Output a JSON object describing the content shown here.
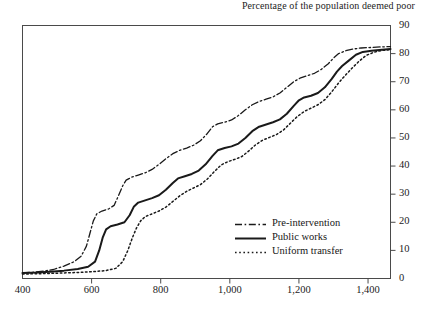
{
  "chart_data": {
    "type": "line",
    "title": "Percentage of the population deemed poor",
    "xlabel": "",
    "ylabel": "",
    "xlim": [
      400,
      1465
    ],
    "ylim": [
      0,
      90
    ],
    "grid": false,
    "legend_position": "inside-bottom-right",
    "xticks": [
      400,
      600,
      800,
      1000,
      1200,
      1400
    ],
    "xtick_labels": [
      "400",
      "600",
      "800",
      "1,000",
      "1,200",
      "1,400"
    ],
    "yticks": [
      0,
      10,
      20,
      30,
      40,
      50,
      60,
      70,
      80,
      90
    ],
    "ytick_labels": [
      "0",
      "10",
      "20",
      "30",
      "40",
      "50",
      "60",
      "70",
      "80",
      "90"
    ],
    "yaxis_side": "right",
    "series": [
      {
        "name": "Pre-intervention",
        "style": "dashdot",
        "points": [
          [
            400,
            2.0
          ],
          [
            430,
            2.2
          ],
          [
            460,
            2.6
          ],
          [
            490,
            3.2
          ],
          [
            520,
            4.4
          ],
          [
            550,
            6.0
          ],
          [
            570,
            8.0
          ],
          [
            585,
            11.5
          ],
          [
            595,
            16.0
          ],
          [
            605,
            20.5
          ],
          [
            615,
            23.0
          ],
          [
            630,
            24.0
          ],
          [
            650,
            24.8
          ],
          [
            665,
            26.0
          ],
          [
            678,
            29.5
          ],
          [
            690,
            33.0
          ],
          [
            700,
            35.0
          ],
          [
            715,
            36.0
          ],
          [
            735,
            36.8
          ],
          [
            755,
            37.6
          ],
          [
            775,
            38.8
          ],
          [
            795,
            40.6
          ],
          [
            815,
            42.6
          ],
          [
            835,
            44.4
          ],
          [
            855,
            45.6
          ],
          [
            875,
            46.4
          ],
          [
            895,
            47.4
          ],
          [
            915,
            49.0
          ],
          [
            935,
            51.6
          ],
          [
            950,
            54.0
          ],
          [
            965,
            55.0
          ],
          [
            985,
            55.6
          ],
          [
            1005,
            56.4
          ],
          [
            1025,
            58.0
          ],
          [
            1045,
            60.0
          ],
          [
            1065,
            61.8
          ],
          [
            1085,
            63.0
          ],
          [
            1105,
            63.8
          ],
          [
            1125,
            64.6
          ],
          [
            1145,
            66.0
          ],
          [
            1165,
            68.0
          ],
          [
            1185,
            70.0
          ],
          [
            1205,
            71.4
          ],
          [
            1225,
            72.2
          ],
          [
            1245,
            73.0
          ],
          [
            1265,
            74.4
          ],
          [
            1285,
            76.4
          ],
          [
            1300,
            78.4
          ],
          [
            1315,
            80.0
          ],
          [
            1335,
            81.0
          ],
          [
            1355,
            81.6
          ],
          [
            1380,
            82.0
          ],
          [
            1410,
            82.2
          ],
          [
            1440,
            82.4
          ],
          [
            1465,
            82.5
          ]
        ]
      },
      {
        "name": "Public works",
        "style": "solid",
        "points": [
          [
            400,
            2.0
          ],
          [
            440,
            2.1
          ],
          [
            480,
            2.4
          ],
          [
            520,
            2.8
          ],
          [
            560,
            3.4
          ],
          [
            590,
            4.2
          ],
          [
            610,
            6.0
          ],
          [
            622,
            10.0
          ],
          [
            632,
            14.5
          ],
          [
            642,
            17.5
          ],
          [
            655,
            18.6
          ],
          [
            675,
            19.2
          ],
          [
            695,
            20.0
          ],
          [
            710,
            22.5
          ],
          [
            722,
            25.5
          ],
          [
            735,
            27.0
          ],
          [
            755,
            27.8
          ],
          [
            775,
            28.6
          ],
          [
            795,
            29.6
          ],
          [
            815,
            31.6
          ],
          [
            835,
            34.0
          ],
          [
            850,
            35.6
          ],
          [
            870,
            36.4
          ],
          [
            890,
            37.2
          ],
          [
            910,
            38.4
          ],
          [
            930,
            40.6
          ],
          [
            950,
            43.6
          ],
          [
            965,
            45.6
          ],
          [
            985,
            46.4
          ],
          [
            1005,
            47.0
          ],
          [
            1025,
            48.0
          ],
          [
            1045,
            50.0
          ],
          [
            1065,
            52.4
          ],
          [
            1085,
            54.0
          ],
          [
            1105,
            54.8
          ],
          [
            1125,
            55.6
          ],
          [
            1145,
            56.6
          ],
          [
            1165,
            58.6
          ],
          [
            1185,
            61.4
          ],
          [
            1200,
            63.4
          ],
          [
            1215,
            64.4
          ],
          [
            1235,
            65.0
          ],
          [
            1255,
            66.0
          ],
          [
            1275,
            68.0
          ],
          [
            1295,
            71.0
          ],
          [
            1310,
            73.6
          ],
          [
            1325,
            75.6
          ],
          [
            1345,
            77.6
          ],
          [
            1365,
            79.6
          ],
          [
            1385,
            80.6
          ],
          [
            1410,
            81.0
          ],
          [
            1440,
            81.4
          ],
          [
            1465,
            81.6
          ]
        ]
      },
      {
        "name": "Uniform transfer",
        "style": "dotted",
        "points": [
          [
            400,
            1.6
          ],
          [
            450,
            1.7
          ],
          [
            500,
            1.9
          ],
          [
            550,
            2.1
          ],
          [
            600,
            2.4
          ],
          [
            640,
            2.8
          ],
          [
            670,
            3.6
          ],
          [
            690,
            6.0
          ],
          [
            705,
            10.0
          ],
          [
            718,
            14.5
          ],
          [
            730,
            18.0
          ],
          [
            742,
            20.5
          ],
          [
            755,
            22.0
          ],
          [
            775,
            23.0
          ],
          [
            795,
            24.0
          ],
          [
            815,
            25.4
          ],
          [
            835,
            27.4
          ],
          [
            855,
            29.4
          ],
          [
            875,
            31.0
          ],
          [
            895,
            32.2
          ],
          [
            915,
            33.4
          ],
          [
            935,
            35.4
          ],
          [
            955,
            38.0
          ],
          [
            975,
            40.4
          ],
          [
            995,
            41.6
          ],
          [
            1015,
            42.4
          ],
          [
            1035,
            43.4
          ],
          [
            1055,
            45.4
          ],
          [
            1075,
            47.6
          ],
          [
            1095,
            49.2
          ],
          [
            1115,
            50.2
          ],
          [
            1135,
            51.2
          ],
          [
            1155,
            52.8
          ],
          [
            1175,
            55.2
          ],
          [
            1195,
            57.6
          ],
          [
            1215,
            59.4
          ],
          [
            1235,
            60.6
          ],
          [
            1255,
            61.8
          ],
          [
            1275,
            63.6
          ],
          [
            1295,
            66.4
          ],
          [
            1315,
            69.6
          ],
          [
            1335,
            72.4
          ],
          [
            1355,
            75.0
          ],
          [
            1375,
            77.4
          ],
          [
            1395,
            79.4
          ],
          [
            1420,
            80.6
          ],
          [
            1445,
            81.2
          ],
          [
            1465,
            81.4
          ]
        ]
      }
    ]
  },
  "legend": {
    "items": [
      {
        "label": "Pre-intervention",
        "style": "dashdot"
      },
      {
        "label": "Public works",
        "style": "solid"
      },
      {
        "label": "Uniform transfer",
        "style": "dotted"
      }
    ]
  },
  "colors": {
    "ink": "#1a1a1a",
    "frame": "#4a4a4a",
    "background": "#ffffff"
  }
}
